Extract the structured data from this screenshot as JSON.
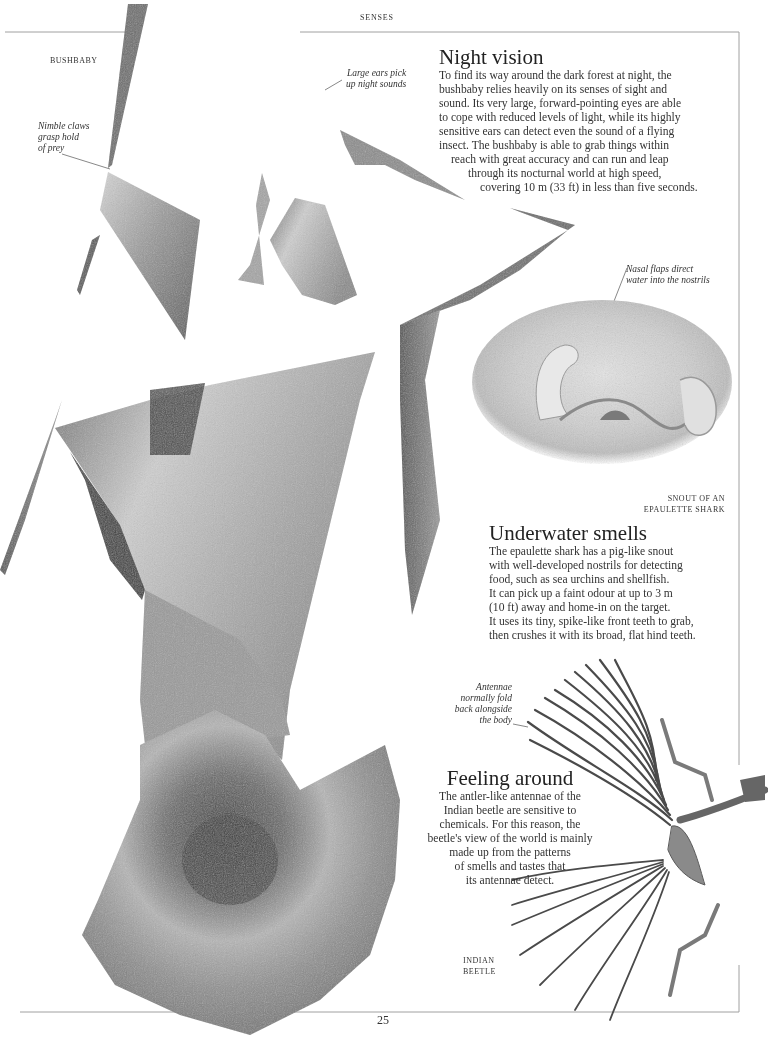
{
  "page": {
    "running_head": "SENSES",
    "page_number": "25"
  },
  "bushbaby": {
    "label": "BUSHBABY",
    "annotations": {
      "claws": [
        "Nimble claws",
        "grasp hold",
        "of prey"
      ],
      "ears": [
        "Large ears pick",
        "up night sounds"
      ]
    }
  },
  "night_vision": {
    "title": "Night vision",
    "lines": [
      "To find its way around the dark forest at night, the",
      "bushbaby relies heavily on its senses of sight and",
      "sound. Its very large, forward-pointing eyes are able",
      "to cope with reduced levels of light, while its highly",
      "sensitive ears can detect even the sound of a flying",
      "insect. The bushbaby is able to grab things within",
      "reach with great accuracy and can run and leap",
      "through its nocturnal world at high speed,",
      "covering 10 m (33 ft) in less than five seconds."
    ]
  },
  "shark": {
    "annotation": [
      "Nasal flaps direct",
      "water into the nostrils"
    ],
    "label": [
      "SNOUT OF AN",
      "EPAULETTE SHARK"
    ]
  },
  "underwater_smells": {
    "title": "Underwater smells",
    "lines": [
      "The epaulette shark has a pig-like snout",
      "with well-developed nostrils for detecting",
      "food, such as sea urchins and shellfish.",
      "It can pick up a faint odour at up to 3 m",
      "(10 ft) away and home-in on the target.",
      "It uses its tiny, spike-like front teeth to grab,",
      "then crushes it with its broad, flat hind teeth."
    ]
  },
  "beetle": {
    "annotation": [
      "Antennae",
      "normally fold",
      "back alongside",
      "the body"
    ],
    "label": [
      "INDIAN",
      "BEETLE"
    ]
  },
  "feeling_around": {
    "title": "Feeling around",
    "lines": [
      "The antler-like antennae of the",
      "Indian beetle are sensitive to",
      "chemicals. For this reason, the",
      "beetle's view of the world is mainly",
      "made up from the patterns",
      "of smells and tastes that",
      "its antennae detect."
    ]
  },
  "colors": {
    "page_bg": "#ffffff",
    "text": "#333333",
    "rule": "#9a9a9a",
    "fur_light": "#c9c9c9",
    "fur_mid": "#8e8e8e",
    "fur_dark": "#3a3a3a"
  }
}
